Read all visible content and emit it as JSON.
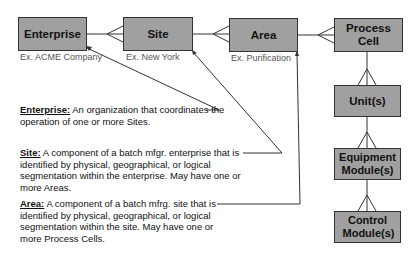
{
  "diagram": {
    "entities": [
      {
        "id": "enterprise",
        "label": "Enterprise",
        "example": "Ex. ACME Company"
      },
      {
        "id": "site",
        "label": "Site",
        "example": "Ex. New York"
      },
      {
        "id": "area",
        "label": "Area",
        "example": "Ex. Purification"
      },
      {
        "id": "process_cell",
        "label": "Process Cell"
      },
      {
        "id": "units",
        "label": "Unit(s)"
      },
      {
        "id": "equipment_modules",
        "label": "Equipment Module(s)"
      },
      {
        "id": "control_modules",
        "label": "Control Module(s)"
      }
    ],
    "definitions": [
      {
        "term": "Enterprise:",
        "text": " An organization that coordinates the operation of one or more Sites."
      },
      {
        "term": "Site:",
        "text": " A component of a batch mfgr. enterprise that is identified by physical, geographical, or logical segmentation within the enterprise. May have one or more Areas."
      },
      {
        "term": "Area:",
        "text": " A component of a batch mfrg. site that is identified by physical, geographical, or logical segmentation within the site. May have one or more Process Cells."
      }
    ],
    "colors": {
      "box_fill": "#a0a0a0",
      "box_border": "#333333",
      "line": "#333333"
    }
  }
}
